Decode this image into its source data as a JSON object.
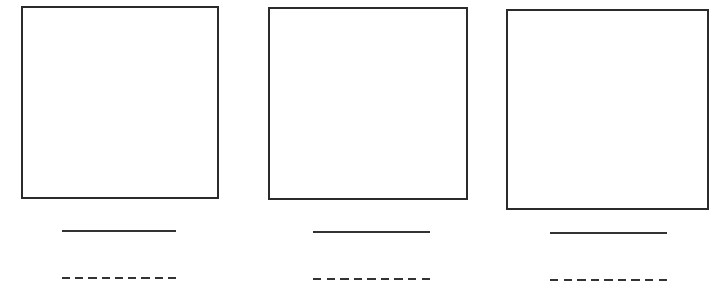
{
  "worksheet": {
    "panels": [
      {
        "id": "panel-1",
        "box": {
          "x": 21,
          "y": 6,
          "w": 198,
          "h": 193
        },
        "solid_line": {
          "x": 62,
          "y": 230,
          "w": 114
        },
        "dashed_line": {
          "x": 62,
          "y": 277,
          "w": 114,
          "dash_count": 9
        }
      },
      {
        "id": "panel-2",
        "box": {
          "x": 268,
          "y": 7,
          "w": 200,
          "h": 193
        },
        "solid_line": {
          "x": 313,
          "y": 231,
          "w": 117
        },
        "dashed_line": {
          "x": 313,
          "y": 278,
          "w": 117,
          "dash_count": 9
        }
      },
      {
        "id": "panel-3",
        "box": {
          "x": 506,
          "y": 9,
          "w": 203,
          "h": 201
        },
        "solid_line": {
          "x": 550,
          "y": 232,
          "w": 117
        },
        "dashed_line": {
          "x": 550,
          "y": 279,
          "w": 117,
          "dash_count": 9
        }
      }
    ],
    "colors": {
      "border": "#2b2b2b",
      "line": "#333333",
      "background": "#ffffff"
    }
  }
}
